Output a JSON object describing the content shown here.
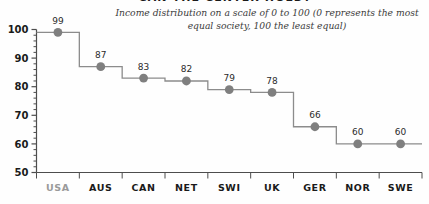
{
  "chart_data": {
    "type": "line",
    "title": "CAN THE CENTER HOLD?",
    "subtitle": "Income distribution on a scale of 0 to 100 (0 represents the most equal society, 100 the least equal)",
    "xlabel": "",
    "ylabel": "",
    "ylim": [
      50,
      100
    ],
    "y_ticks": [
      100,
      90,
      80,
      70,
      60,
      50
    ],
    "y_minor_step": 2,
    "grid": false,
    "legend": null,
    "step_style": "step-mid",
    "marker": "circle",
    "categories": [
      "USA",
      "AUS",
      "CAN",
      "NET",
      "SWI",
      "UK",
      "GER",
      "NOR",
      "SWE"
    ],
    "values": [
      99,
      87,
      83,
      82,
      79,
      78,
      66,
      60,
      60
    ],
    "point_labels": [
      "99",
      "87",
      "83",
      "82",
      "79",
      "78",
      "66",
      "60",
      "60"
    ],
    "highlight_category": "USA",
    "colors": {
      "background": "#fefefe",
      "line": "#8c8c8c",
      "marker": "#7f7f7f",
      "axis": "#4d4d4d",
      "title": "#1a1a1a",
      "subtitle": "#3b3b3b",
      "tick_label": "#1a1a1a",
      "value_label": "#2b2b2b",
      "category_label": "#1a1a1a",
      "highlight_category_label": "#9a9a9a"
    }
  },
  "axis": {
    "y_labels": [
      "100",
      "90",
      "80",
      "70",
      "60",
      "50"
    ]
  }
}
